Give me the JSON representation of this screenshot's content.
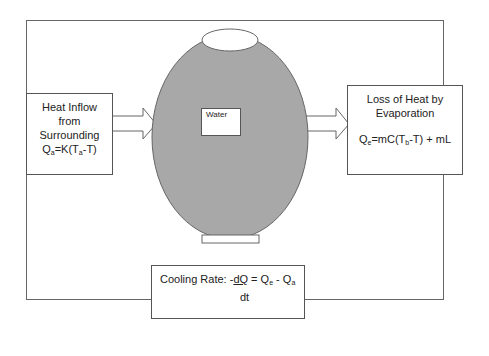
{
  "diagram": {
    "colors": {
      "vessel_fill": "#a8a8a8",
      "stroke": "#555555",
      "background": "#ffffff"
    },
    "left_box": {
      "lines": [
        "Heat Inflow",
        "from",
        "Surrounding"
      ],
      "formula": {
        "Q": "Q",
        "Q_sub": "a",
        "eq": "=K(T",
        "T_sub": "a",
        "rest": "-T)"
      }
    },
    "right_box": {
      "lines": [
        "Loss of Heat by",
        "Evaporation"
      ],
      "formula": {
        "Q": "Q",
        "Q_sub": "e",
        "eq": "=mC(T",
        "T_sub": "b",
        "rest": "-T) + mL"
      }
    },
    "vessel_label": "Water",
    "bottom_box": {
      "prefix": "Cooling Rate: -",
      "numerator": "dQ",
      "eq": " = Q",
      "e_sub": "e",
      "minus": " - Q",
      "a_sub": "a",
      "denominator": "dt"
    }
  }
}
